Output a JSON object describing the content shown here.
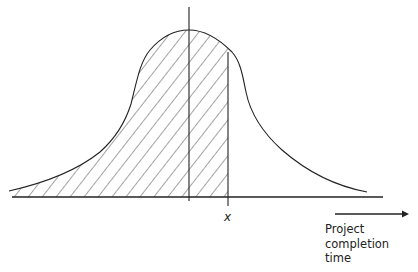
{
  "diagram": {
    "type": "probability-distribution",
    "x_marker_label": "x",
    "axis_title_lines": [
      "Project",
      "completion",
      "time"
    ],
    "colors": {
      "line": "#222222",
      "background": "#ffffff"
    }
  }
}
